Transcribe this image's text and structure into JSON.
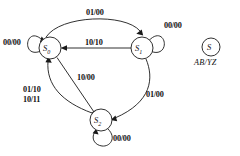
{
  "diagram": {
    "type": "state-transition-diagram",
    "states": [
      {
        "id": "S0",
        "name": "S",
        "subscript": "0",
        "cx": 50,
        "cy": 48,
        "r": 11
      },
      {
        "id": "S1",
        "name": "S",
        "subscript": "1",
        "cx": 142,
        "cy": 48,
        "r": 11
      },
      {
        "id": "S2",
        "name": "S",
        "subscript": "2",
        "cx": 101,
        "cy": 120,
        "r": 11
      }
    ],
    "transitions": [
      {
        "from": "S0",
        "to": "S0",
        "label": "00/00",
        "kind": "self-loop-left"
      },
      {
        "from": "S0",
        "to": "S1",
        "label": "01/00",
        "kind": "arc-top"
      },
      {
        "from": "S1",
        "to": "S0",
        "label": "10/10",
        "kind": "straight-horizontal"
      },
      {
        "from": "S1",
        "to": "S1",
        "label": "00/00",
        "kind": "self-loop-right"
      },
      {
        "from": "S1",
        "to": "S2",
        "label": "01/00",
        "kind": "arc-right"
      },
      {
        "from": "S0",
        "to": "S2",
        "label": "10/00",
        "kind": "straight-diagonal"
      },
      {
        "from": "S2",
        "to": "S0",
        "label": "01/10\n10/11",
        "label_line1": "01/10",
        "label_line2": "10/11",
        "kind": "arc-left"
      },
      {
        "from": "S2",
        "to": "S2",
        "label": "00/00",
        "kind": "self-loop-bottom"
      }
    ],
    "labels": {
      "s0_self": "00/00",
      "top_arc": "01/00",
      "horizontal": "10/10",
      "s1_self": "00/00",
      "right_arc": "01/00",
      "diagonal": "10/00",
      "left_arc_line1": "01/10",
      "left_arc_line2": "10/11",
      "s2_self": "00/00"
    },
    "legend": {
      "state_symbol": "S",
      "notation": "AB/YZ",
      "cx": 211,
      "cy": 47,
      "r": 9
    },
    "colors": {
      "stroke": "#1a1a1a",
      "text": "#111111",
      "background": "#ffffff"
    }
  }
}
